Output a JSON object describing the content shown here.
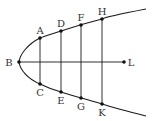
{
  "diagram": {
    "type": "parabola-ordinates",
    "colors": {
      "stroke": "#1a1a1a",
      "label": "#333333",
      "background": "#ffffff"
    },
    "labels": {
      "B": "B",
      "L": "L",
      "A": "A",
      "C": "C",
      "D": "D",
      "E": "E",
      "F": "F",
      "G": "G",
      "H": "H",
      "K": "K"
    },
    "points": {
      "B": [
        19,
        62
      ],
      "L": [
        124,
        62
      ],
      "A": [
        40,
        38
      ],
      "C": [
        40,
        84
      ],
      "D": [
        61,
        31
      ],
      "E": [
        61,
        92
      ],
      "F": [
        81,
        25
      ],
      "G": [
        81,
        98
      ],
      "H": [
        102,
        19
      ],
      "K": [
        102,
        104
      ]
    },
    "segments": [
      [
        "B",
        "L"
      ],
      [
        "A",
        "C"
      ],
      [
        "D",
        "E"
      ],
      [
        "F",
        "G"
      ],
      [
        "H",
        "K"
      ]
    ],
    "curve": "parabola with vertex B, opening right, axis BL"
  }
}
